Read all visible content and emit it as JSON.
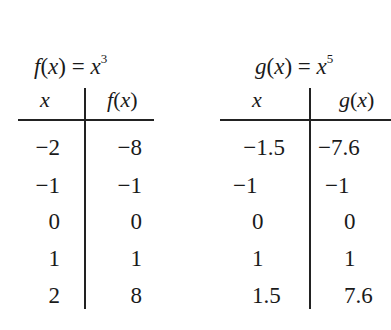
{
  "tables": [
    {
      "title_func": "f",
      "title_exp": "3",
      "col_headers": [
        "x",
        "f(x)"
      ],
      "rows": [
        [
          "−2",
          "−8"
        ],
        [
          "−1",
          "−1"
        ],
        [
          "0",
          "0"
        ],
        [
          "1",
          "1"
        ],
        [
          "2",
          "8"
        ]
      ]
    },
    {
      "title_func": "g",
      "title_exp": "5",
      "col_headers": [
        "x",
        "g(x)"
      ],
      "rows": [
        [
          "−1.5",
          "−7.6"
        ],
        [
          "−1",
          "−1"
        ],
        [
          "0",
          "0"
        ],
        [
          "1",
          "1"
        ],
        [
          "1.5",
          "7.6"
        ]
      ]
    }
  ],
  "labels": {
    "f_title": "f(x) = x",
    "g_title": "g(x) = x"
  }
}
